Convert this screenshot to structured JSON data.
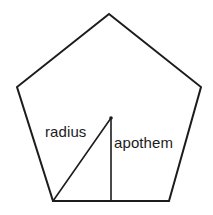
{
  "figure": {
    "background_color": "#ffffff",
    "stroke_color": "#1c1c1c",
    "text_color": "#1c1c1c",
    "width": 213,
    "height": 215
  },
  "shape": {
    "name": "regular-pentagon",
    "sides": 5,
    "stroke_width": 2,
    "fill": "none",
    "vertices": [
      {
        "name": "apex",
        "x": 109,
        "y": 14
      },
      {
        "name": "upper-right",
        "x": 201,
        "y": 87
      },
      {
        "name": "bottom-right",
        "x": 169,
        "y": 201
      },
      {
        "name": "bottom-left",
        "x": 53,
        "y": 201
      },
      {
        "name": "upper-left",
        "x": 17,
        "y": 87
      }
    ],
    "points_attr": "109,14 201,87 169,201 53,201 17,87"
  },
  "center": {
    "name": "center-point",
    "x": 111,
    "y": 118,
    "dot_radius": 1.8
  },
  "segments": {
    "radius": {
      "label": "radius",
      "stroke_width": 1.6,
      "x1": 111,
      "y1": 118,
      "x2": 53,
      "y2": 201
    },
    "apothem": {
      "label": "apothem",
      "stroke_width": 1.6,
      "x1": 111,
      "y1": 118,
      "x2": 111,
      "y2": 201
    }
  },
  "labels": {
    "radius_text": "radius",
    "apothem_text": "apothem"
  }
}
